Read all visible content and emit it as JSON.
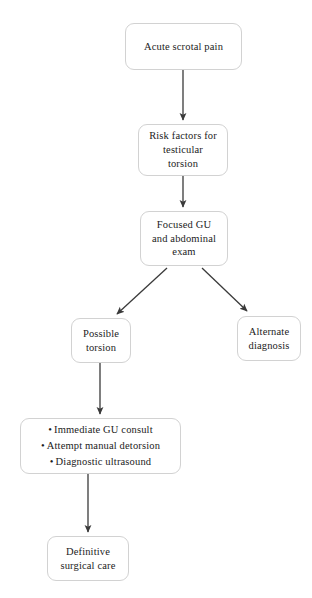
{
  "diagram": {
    "type": "flowchart",
    "colors": {
      "node_border": "#d2d2d2",
      "node_fill": "#ffffff",
      "connector": "#3a3a3a",
      "text": "#1c1c1c"
    },
    "nodes": [
      {
        "id": "acute-scrotal-pain",
        "label": "Acute scrotal pain",
        "shape": "rounded-rect"
      },
      {
        "id": "risk-factors",
        "label": "Risk factors for\ntesticular\ntorsion",
        "shape": "rounded-rect"
      },
      {
        "id": "focused-exam",
        "label": "Focused GU\nand abdominal\nexam",
        "shape": "rounded-rect"
      },
      {
        "id": "possible-torsion",
        "label": "Possible\ntorsion",
        "shape": "rounded-rect"
      },
      {
        "id": "alternate-diagnosis",
        "label": "Alternate\ndiagnosis",
        "shape": "rounded-rect"
      },
      {
        "id": "management",
        "shape": "rounded-rect",
        "bullet_char": "•",
        "bullets": [
          "Immediate GU consult",
          "Attempt manual detorsion",
          "Diagnostic ultrasound"
        ]
      },
      {
        "id": "definitive-care",
        "label": "Definitive\nsurgical care",
        "shape": "rounded-rect"
      }
    ],
    "edges": [
      {
        "id": "edge-pain-to-risk",
        "from": "acute-scrotal-pain",
        "to": "risk-factors",
        "style": "straight-vertical",
        "arrowhead": true
      },
      {
        "id": "edge-risk-to-exam",
        "from": "risk-factors",
        "to": "focused-exam",
        "style": "straight-vertical",
        "arrowhead": true
      },
      {
        "id": "edge-exam-to-torsion",
        "from": "focused-exam",
        "to": "possible-torsion",
        "style": "diagonal-left",
        "arrowhead": true
      },
      {
        "id": "edge-exam-to-alternate",
        "from": "focused-exam",
        "to": "alternate-diagnosis",
        "style": "diagonal-right",
        "arrowhead": true
      },
      {
        "id": "edge-torsion-to-mgmt",
        "from": "possible-torsion",
        "to": "management",
        "style": "straight-vertical",
        "arrowhead": true
      },
      {
        "id": "edge-mgmt-to-definitive",
        "from": "management",
        "to": "definitive-care",
        "style": "straight-vertical",
        "arrowhead": true
      }
    ]
  }
}
